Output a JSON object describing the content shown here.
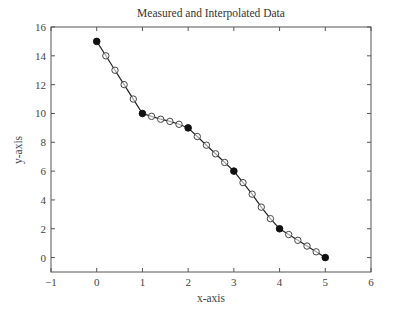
{
  "chart_data": {
    "type": "line",
    "title": "Measured and Interpolated Data",
    "xlabel": "x-axis",
    "ylabel": "y-axis",
    "xlim": [
      -1,
      6
    ],
    "ylim": [
      -1,
      16
    ],
    "xticks": [
      -1,
      0,
      1,
      2,
      3,
      4,
      5,
      6
    ],
    "yticks": [
      0,
      2,
      4,
      6,
      8,
      10,
      12,
      14,
      16
    ],
    "grid": false,
    "legend": null,
    "series": [
      {
        "name": "Measured",
        "marker": "filled-circle",
        "x": [
          0,
          1,
          2,
          3,
          4,
          5
        ],
        "y": [
          15,
          10,
          9,
          6,
          2,
          0
        ]
      },
      {
        "name": "Interpolated",
        "marker": "open-circle",
        "line": "solid",
        "x": [
          0,
          0.2,
          0.4,
          0.6,
          0.8,
          1,
          1.2,
          1.4,
          1.6,
          1.8,
          2,
          2.2,
          2.4,
          2.6,
          2.8,
          3,
          3.2,
          3.4,
          3.6,
          3.8,
          4,
          4.2,
          4.4,
          4.6,
          4.8,
          5
        ],
        "y": [
          15,
          14,
          13,
          12,
          11,
          10,
          9.8,
          9.6,
          9.45,
          9.25,
          9,
          8.4,
          7.8,
          7.2,
          6.6,
          6,
          5.2,
          4.4,
          3.5,
          2.7,
          2,
          1.6,
          1.2,
          0.8,
          0.4,
          0
        ]
      }
    ]
  },
  "colors": {
    "axis": "#555555",
    "line": "#222222",
    "marker_fill": "#111111",
    "open_marker_stroke": "#444444"
  }
}
